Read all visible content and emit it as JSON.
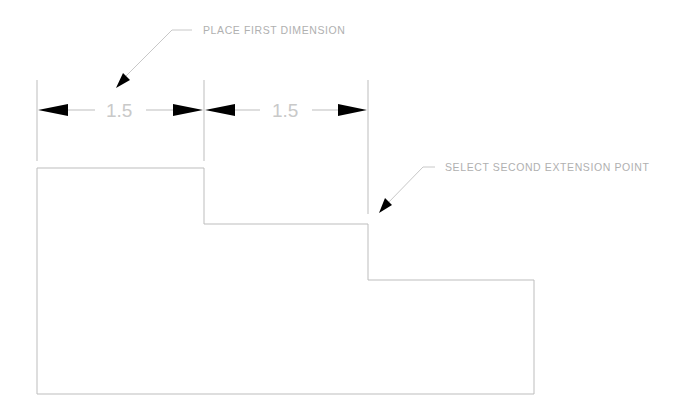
{
  "drawing": {
    "annotations": {
      "first": "PLACE FIRST DIMENSION",
      "second": "SELECT SECOND EXTENSION POINT"
    },
    "dimensions": [
      {
        "label": "1.5"
      },
      {
        "label": "1.5"
      }
    ],
    "colors": {
      "background": "#ffffff",
      "linework": "#bdbdbd",
      "arrowheads": "#000000",
      "text": "#b0b0b0"
    }
  }
}
